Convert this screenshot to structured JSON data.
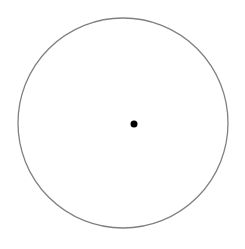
{
  "diagram": {
    "type": "geometry",
    "canvas": {
      "width": 245,
      "height": 249,
      "background": "#ffffff"
    },
    "circle": {
      "cx": 123,
      "cy": 123,
      "r": 105,
      "stroke": "#808080",
      "stroke_width": 1.3,
      "fill": "none"
    },
    "point": {
      "cx": 134,
      "cy": 124,
      "r": 3.5,
      "fill": "#000000"
    }
  }
}
